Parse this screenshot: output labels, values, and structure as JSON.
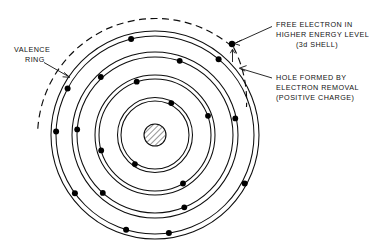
{
  "figure": {
    "background_color": "#ffffff",
    "line_color": "#0d0d0d",
    "text_color": "#111111"
  },
  "labels": {
    "valence": {
      "name": "valence-ring-label",
      "lines": [
        "VALENCE",
        "RING"
      ]
    },
    "free_electron": {
      "name": "free-electron-label",
      "lines": [
        "FREE ELECTRON IN",
        "HIGHER ENERGY LEVEL",
        "(3d SHELL)"
      ]
    },
    "hole": {
      "name": "hole-label",
      "lines": [
        "HOLE  FORMED BY",
        "ELECTRON REMOVAL",
        "(POSITIVE CHARGE)"
      ]
    }
  },
  "atom": {
    "center": {
      "x": 155,
      "y": 135
    },
    "nucleus": {
      "radius": 11,
      "fill_pattern": "diagonal-hatch",
      "fill_color": "#ffffff",
      "hatch_color": "#2b2b2b"
    },
    "shells": [
      {
        "name": "shell-1-inner",
        "inner_radius": 34,
        "outer_radius": 37.5
      },
      {
        "name": "shell-2",
        "inner_radius": 56,
        "outer_radius": 60
      },
      {
        "name": "shell-3",
        "inner_radius": 78,
        "outer_radius": 83
      },
      {
        "name": "shell-4-valence",
        "inner_radius": 99,
        "outer_radius": 104
      }
    ],
    "free_shell": {
      "name": "shell-5-free-dashed",
      "radius": 118,
      "dashed": true,
      "arc_start_deg": 183,
      "arc_end_deg": 310
    },
    "electrons": [
      {
        "shell": 1,
        "angle_deg": 63
      },
      {
        "shell": 1,
        "angle_deg": 235
      },
      {
        "shell": 2,
        "angle_deg": 20
      },
      {
        "shell": 2,
        "angle_deg": 108
      },
      {
        "shell": 2,
        "angle_deg": 196
      },
      {
        "shell": 2,
        "angle_deg": 300
      },
      {
        "shell": 3,
        "angle_deg": 12
      },
      {
        "shell": 3,
        "angle_deg": 72
      },
      {
        "shell": 3,
        "angle_deg": 132
      },
      {
        "shell": 3,
        "angle_deg": 184
      },
      {
        "shell": 3,
        "angle_deg": 228
      },
      {
        "shell": 3,
        "angle_deg": 292
      },
      {
        "shell": 4,
        "angle_deg": 50
      },
      {
        "shell": 4,
        "angle_deg": 104
      },
      {
        "shell": 4,
        "angle_deg": 152
      },
      {
        "shell": 4,
        "angle_deg": 182
      },
      {
        "shell": 4,
        "angle_deg": 216
      },
      {
        "shell": 4,
        "angle_deg": 253
      },
      {
        "shell": 4,
        "angle_deg": 278
      },
      {
        "shell": 4,
        "angle_deg": 330
      }
    ],
    "free_electron_marker": {
      "name": "free-electron-dot",
      "x": 232,
      "y": 44,
      "radius": 3.1
    },
    "hole_marker": {
      "name": "hole-gap",
      "x": 246,
      "y": 68
    }
  },
  "annotations": {
    "valence_leader": {
      "name": "valence-leader-line"
    },
    "free_electron_leader": {
      "name": "free-electron-leader-line"
    },
    "free_electron_arrow": {
      "name": "free-electron-up-arrow"
    },
    "hole_leader": {
      "name": "hole-leader-line"
    }
  }
}
